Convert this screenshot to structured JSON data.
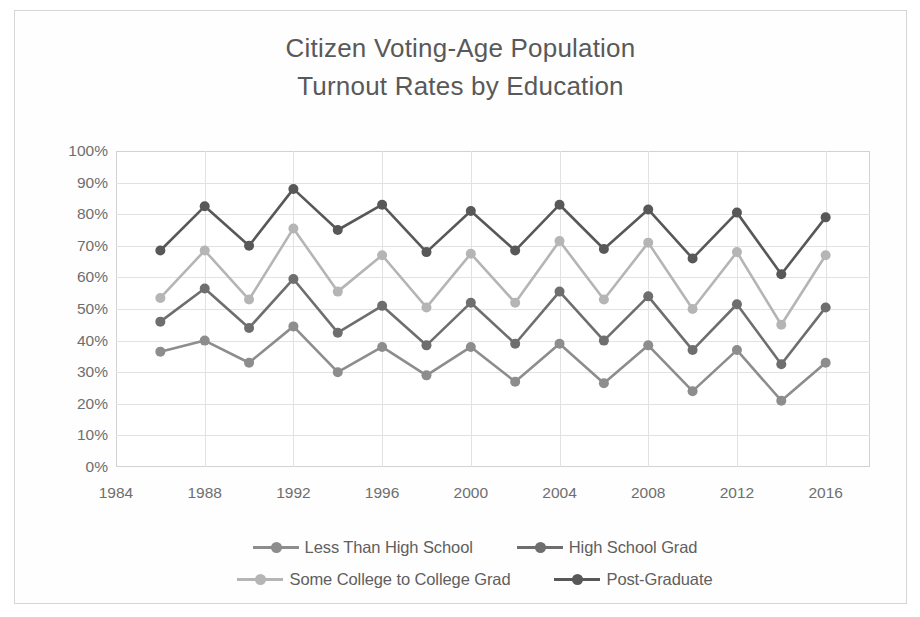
{
  "chart_data": {
    "type": "line",
    "title": "Citizen Voting-Age Population Turnout Rates by Education",
    "title_line1": "Citizen Voting-Age Population",
    "title_line2": "Turnout Rates by Education",
    "xlabel": "",
    "ylabel": "",
    "ylim": [
      0,
      100
    ],
    "xlim": [
      1984,
      2018
    ],
    "grid": true,
    "legend_position": "bottom",
    "y_ticks": [
      "0%",
      "10%",
      "20%",
      "30%",
      "40%",
      "50%",
      "60%",
      "70%",
      "80%",
      "90%",
      "100%"
    ],
    "x_ticks": [
      "1984",
      "1988",
      "1992",
      "1996",
      "2000",
      "2004",
      "2008",
      "2012",
      "2016"
    ],
    "x": [
      1986,
      1988,
      1990,
      1992,
      1994,
      1996,
      1998,
      2000,
      2002,
      2004,
      2006,
      2008,
      2010,
      2012,
      2014,
      2016
    ],
    "series": [
      {
        "name": "Less Than High School",
        "color": "#8d8d8d",
        "values": [
          36.5,
          40,
          33,
          44.5,
          30,
          38,
          29,
          38,
          27,
          39,
          26.5,
          38.5,
          24,
          37,
          21,
          33
        ]
      },
      {
        "name": "High School Grad",
        "color": "#6e6e6e",
        "values": [
          46,
          56.5,
          44,
          59.5,
          42.5,
          51,
          38.5,
          52,
          39,
          55.5,
          40,
          54,
          37,
          51.5,
          32.5,
          50.5
        ]
      },
      {
        "name": "Some College to College Grad",
        "color": "#b5b5b5",
        "values": [
          53.5,
          68.5,
          53,
          75.5,
          55.5,
          67,
          50.5,
          67.5,
          52,
          71.5,
          53,
          71,
          50,
          68,
          45,
          67
        ]
      },
      {
        "name": "Post-Graduate",
        "color": "#585858",
        "values": [
          68.5,
          82.5,
          70,
          88,
          75,
          83,
          68,
          81,
          68.5,
          83,
          69,
          81.5,
          66,
          80.5,
          61,
          79
        ]
      }
    ]
  },
  "legend": {
    "rows": [
      [
        "Less Than High School",
        "High School Grad"
      ],
      [
        "Some College to College Grad",
        "Post-Graduate"
      ]
    ]
  },
  "colors": {
    "grid": "#e2e2e2",
    "axis": "#d2d2d2",
    "text": "#6e6e6e",
    "title": "#595959",
    "frame": "#d6d6d6"
  }
}
